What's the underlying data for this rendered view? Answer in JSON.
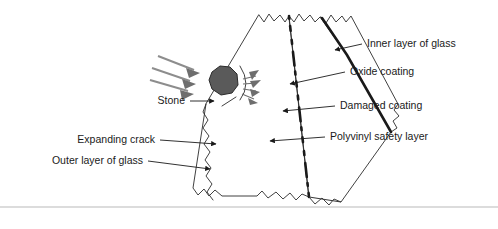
{
  "figure": {
    "background_color": "#ffffff",
    "width": 498,
    "height": 229
  },
  "colors": {
    "stone_fill": "#5a5a5a",
    "stone_stroke": "#2b2b2b",
    "impact_arrow": "#8d8d8d",
    "crack_burst": "#6e6e6e",
    "polyvinyl_fill": "#c8c8c8",
    "oxide_coating": "#1a1a1a",
    "damaged_coating": "#1a1a1a",
    "glass_fill": "#ffffff",
    "outline": "#2b2b2b",
    "label_text": "#1a1a1a",
    "leader_line": "#1a1a1a",
    "footer_rule": "#b9b9b9"
  },
  "labels": {
    "left": [
      {
        "id": "stone",
        "text": "Stone",
        "text_x": 185,
        "text_y": 101,
        "leader_points": "190,101 216,101",
        "arrow_at": "end"
      },
      {
        "id": "expanding-crack",
        "text": "Expanding crack",
        "text_x": 155,
        "text_y": 140,
        "leader_points": "160,140 218,144",
        "arrow_at": "end"
      },
      {
        "id": "outer-layer-of-glass",
        "text": "Outer layer of glass",
        "text_x": 143,
        "text_y": 161,
        "leader_points": "148,161 212,168",
        "arrow_at": "end"
      }
    ],
    "right": [
      {
        "id": "inner-layer-of-glass",
        "text": "Inner layer of glass",
        "text_x": 367,
        "text_y": 44,
        "leader_points": "362,44 333,50",
        "arrow_at": "end"
      },
      {
        "id": "oxide-coating",
        "text": "Oxide coating",
        "text_x": 350,
        "text_y": 72,
        "leader_points": "345,72 288,84",
        "arrow_at": "end"
      },
      {
        "id": "damaged-coating",
        "text": "Damaged coating",
        "text_x": 340,
        "text_y": 106,
        "leader_points": "335,106 281,111",
        "arrow_at": "end"
      },
      {
        "id": "polyvinyl-safety-layer",
        "text": "Polyvinyl safety layer",
        "text_x": 330,
        "text_y": 137,
        "leader_points": "325,137 268,141",
        "arrow_at": "end"
      }
    ]
  },
  "elements": {
    "stone_shape": "212,72 220,66 230,67 237,74 238,85 232,93 221,95 212,89 209,80",
    "impact_arrows": [
      {
        "id": "impact-arrow-1",
        "line": "158,56 196,71",
        "head": "196,71 186,68 188,77"
      },
      {
        "id": "impact-arrow-2",
        "line": "152,68 192,82",
        "head": "192,82 182,79 184,88"
      },
      {
        "id": "impact-arrow-3",
        "line": "150,80 190,92",
        "head": "190,92 180,90 181,99"
      }
    ],
    "crack_burst_rays": [
      {
        "id": "burst-ray-1",
        "line": "243,79 256,76"
      },
      {
        "id": "burst-ray-2",
        "line": "243,84 257,83"
      },
      {
        "id": "burst-ray-3",
        "line": "243,89 256,91"
      },
      {
        "id": "burst-ray-4",
        "line": "242,94 254,99"
      }
    ],
    "burst_wedges": [
      "248,74 258,72 252,80",
      "249,82 260,81 252,88",
      "249,90 259,92 251,96",
      "248,97 257,101 249,103"
    ],
    "outer_glass_front_edge": "206,104 203,112 208,120 203,128 209,136 204,144 210,152 205,160 211,168 206,176 212,184 207,192 213,200 209,206",
    "footer_rule_y": 207
  },
  "accessibility": {
    "alt": "Labelled cross-section diagram showing a stone striking the outer layer of laminated glass, producing an expanding crack, with oxide coating, damaged coating, polyvinyl safety layer and inner layer of glass identified."
  }
}
